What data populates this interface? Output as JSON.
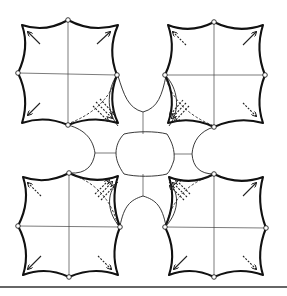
{
  "diagram": {
    "colors": {
      "background": "#ffffff",
      "stroke": "#111111"
    },
    "modules": [
      {
        "id": "top-left",
        "center": [
          68,
          73
        ],
        "arrows": [
          "solid",
          "solid",
          "solid",
          "dashed-bundle"
        ]
      },
      {
        "id": "top-right",
        "center": [
          214,
          74
        ],
        "arrows": [
          "dashed",
          "solid",
          "dashed-bundle",
          "dashed"
        ]
      },
      {
        "id": "bottom-left",
        "center": [
          70,
          225
        ],
        "arrows": [
          "dashed",
          "dashed-bundle",
          "solid",
          "dashed"
        ]
      },
      {
        "id": "bottom-right",
        "center": [
          215,
          226
        ],
        "arrows": [
          "dashed-bundle",
          "solid",
          "solid",
          "dashed"
        ]
      }
    ],
    "center_panel": {
      "shape": "octagon",
      "center": [
        145,
        154
      ]
    },
    "bottom_rule": true
  }
}
